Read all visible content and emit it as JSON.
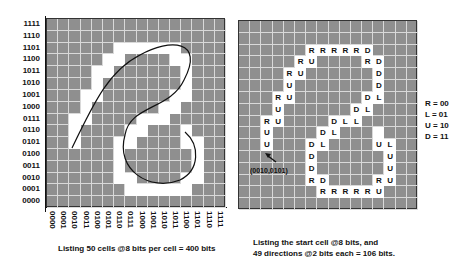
{
  "left_panel": {
    "y_labels": [
      "1111",
      "1110",
      "1101",
      "1100",
      "1011",
      "1010",
      "1001",
      "1000",
      "0111",
      "0110",
      "0101",
      "0100",
      "0011",
      "0010",
      "0001",
      "0000"
    ],
    "x_labels": [
      "0000",
      "0001",
      "0010",
      "0011",
      "0100",
      "0101",
      "0110",
      "0111",
      "1000",
      "1001",
      "1010",
      "1011",
      "1100",
      "1101",
      "1110",
      "1111"
    ],
    "caption": "Listing 50 cells @8 bits per cell = 400 bits"
  },
  "right_panel": {
    "start_label": "(0010,0101)",
    "legend": [
      "R = 00",
      "L = 01",
      "U = 10",
      "D = 11"
    ],
    "caption_line1": "Listing the start cell @8 bits, and",
    "caption_line2": "49 directions @2 bits each = 106 bits."
  },
  "cells": [
    [
      2,
      5,
      "U"
    ],
    [
      2,
      6,
      "U"
    ],
    [
      2,
      7,
      "R"
    ],
    [
      3,
      7,
      "U"
    ],
    [
      3,
      8,
      "U"
    ],
    [
      3,
      9,
      "R"
    ],
    [
      4,
      9,
      "U"
    ],
    [
      4,
      10,
      "U"
    ],
    [
      4,
      11,
      "R"
    ],
    [
      5,
      11,
      "U"
    ],
    [
      5,
      12,
      "R"
    ],
    [
      6,
      12,
      "U"
    ],
    [
      6,
      13,
      "R"
    ],
    [
      7,
      13,
      "R"
    ],
    [
      8,
      13,
      "R"
    ],
    [
      9,
      13,
      "R"
    ],
    [
      10,
      13,
      "R"
    ],
    [
      11,
      13,
      "D"
    ],
    [
      11,
      12,
      "R"
    ],
    [
      12,
      12,
      "D"
    ],
    [
      12,
      11,
      "D"
    ],
    [
      12,
      10,
      "D"
    ],
    [
      12,
      9,
      "L"
    ],
    [
      11,
      9,
      "D"
    ],
    [
      11,
      8,
      "L"
    ],
    [
      10,
      8,
      "D"
    ],
    [
      10,
      7,
      "L"
    ],
    [
      9,
      7,
      "L"
    ],
    [
      8,
      7,
      "D"
    ],
    [
      8,
      6,
      "L"
    ],
    [
      7,
      6,
      "D"
    ],
    [
      7,
      5,
      "L"
    ],
    [
      6,
      5,
      "D"
    ],
    [
      6,
      4,
      "D"
    ],
    [
      6,
      3,
      "D"
    ],
    [
      6,
      2,
      "R"
    ],
    [
      7,
      2,
      "D"
    ],
    [
      7,
      1,
      "R"
    ],
    [
      8,
      1,
      "R"
    ],
    [
      9,
      1,
      "R"
    ],
    [
      10,
      1,
      "R"
    ],
    [
      11,
      1,
      "R"
    ],
    [
      12,
      1,
      "U"
    ],
    [
      12,
      2,
      "R"
    ],
    [
      13,
      2,
      "U"
    ],
    [
      13,
      3,
      "U"
    ],
    [
      13,
      4,
      "U"
    ],
    [
      13,
      5,
      "L"
    ],
    [
      12,
      5,
      "U"
    ],
    [
      12,
      6,
      ""
    ]
  ],
  "colors": {
    "grid_fill": "#8f8f8f",
    "grid_lines": "#d9d9d9",
    "path_cells": "#ffffff"
  }
}
